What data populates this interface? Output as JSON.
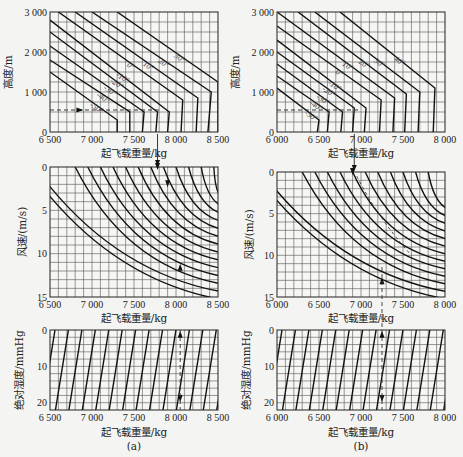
{
  "chart_data": [
    {
      "panel": "a",
      "caption": "(a)",
      "subcharts": [
        {
          "id": "a-top",
          "type": "line",
          "xlabel": "起飞载重量/kg",
          "ylabel": "高度/m",
          "xlim": [
            6500,
            8500
          ],
          "ylim": [
            0,
            3000
          ],
          "xticks": [
            6500,
            7000,
            7500,
            8000,
            8500
          ],
          "xtick_labels": [
            "6 500",
            "7 000",
            "7 500",
            "8 000",
            "8 500"
          ],
          "yticks": [
            0,
            1000,
            2000,
            3000
          ],
          "ytick_labels": [
            "0",
            "1 000",
            "2 000",
            "3 000"
          ],
          "grid": true,
          "grid_nx": 20,
          "grid_ny": 12,
          "series_note": "Temperature lines (°C); diagonal segment then near-vertical segment to 0 m",
          "series": [
            {
              "name": "-50°",
              "kink": [
                7300,
                300
              ],
              "top": [
                6500,
                1500
              ],
              "bottom": [
                7300,
                0
              ]
            },
            {
              "name": "-40°",
              "kink": [
                7450,
                500
              ],
              "top": [
                6500,
                1800
              ],
              "bottom": [
                7450,
                0
              ]
            },
            {
              "name": "-30°",
              "kink": [
                7620,
                500
              ],
              "top": [
                6500,
                2150
              ],
              "bottom": [
                7600,
                0
              ]
            },
            {
              "name": "-20°",
              "kink": [
                7780,
                500
              ],
              "top": [
                6500,
                2500
              ],
              "bottom": [
                7760,
                0
              ]
            },
            {
              "name": "-10°",
              "kink": [
                7920,
                500
              ],
              "top": [
                6500,
                2800
              ],
              "bottom": [
                7900,
                0
              ]
            },
            {
              "name": "0°",
              "kink": [
                8080,
                800
              ],
              "top": [
                6600,
                3000
              ],
              "bottom": [
                8060,
                0
              ]
            },
            {
              "name": "10°",
              "kink": [
                8260,
                850
              ],
              "top": [
                6800,
                3000
              ],
              "bottom": [
                8240,
                0
              ]
            },
            {
              "name": "20°",
              "kink": [
                8420,
                1000
              ],
              "top": [
                7000,
                3000
              ],
              "bottom": [
                8380,
                0
              ]
            },
            {
              "name": "30°",
              "kink": [
                8500,
                1250
              ],
              "top": [
                7300,
                3000
              ],
              "bottom": [
                8500,
                1250
              ]
            }
          ],
          "annotations": [
            {
              "type": "dashed-line",
              "y": 550,
              "x_from": 6500,
              "x_to": 7800
            },
            {
              "type": "arrow",
              "at": [
                6850,
                550
              ],
              "direction": "right"
            }
          ]
        },
        {
          "id": "a-mid",
          "type": "line",
          "xlabel": "起飞载重量/kg",
          "ylabel": "风速/(m/s)",
          "xlim": [
            6500,
            8500
          ],
          "ylim": [
            0,
            15
          ],
          "y_inverted": true,
          "xticks": [
            6500,
            7000,
            7500,
            8000,
            8500
          ],
          "xtick_labels": [
            "6 500",
            "7 000",
            "7 500",
            "8 000",
            "8 500"
          ],
          "yticks": [
            0,
            5,
            10,
            15
          ],
          "ytick_labels": [
            "0",
            "5",
            "10",
            "15"
          ],
          "grid": true,
          "grid_nx": 20,
          "grid_ny": 15,
          "series_note": "Family of curved guide lines starting at 0 m/s and descending right",
          "series_starts_x": [
            6500,
            6650,
            6800,
            6950,
            7100,
            7250,
            7400,
            7550,
            7700,
            7850,
            8000,
            8150,
            8300,
            8450
          ],
          "annotations": [
            {
              "type": "arrow",
              "at": [
                7780,
                0
              ],
              "direction": "down",
              "from_chart": "a-top"
            },
            {
              "type": "arrow",
              "at": [
                7900,
                2
              ],
              "direction": "down"
            },
            {
              "type": "arrow",
              "at": [
                8050,
                11.5
              ],
              "direction": "up"
            }
          ]
        },
        {
          "id": "a-bottom",
          "type": "line",
          "xlabel": "起飞载重量/kg",
          "ylabel": "绝对湿度/mmHg",
          "xlim": [
            6500,
            8500
          ],
          "ylim": [
            0,
            22
          ],
          "y_inverted": true,
          "xticks": [
            6500,
            7000,
            7500,
            8000,
            8500
          ],
          "xtick_labels": [
            "6 500",
            "7 000",
            "7 500",
            "8 000",
            "8 500"
          ],
          "yticks": [
            0,
            10,
            20
          ],
          "ytick_labels": [
            "0",
            "10",
            "20"
          ],
          "grid": true,
          "grid_nx": 20,
          "grid_ny": 11,
          "series_note": "Parallel slanted guide lines",
          "annotations": [
            {
              "type": "arrow",
              "at": [
                8050,
                1
              ],
              "direction": "up"
            },
            {
              "type": "arrow",
              "at": [
                8050,
                19
              ],
              "direction": "down"
            }
          ]
        }
      ]
    },
    {
      "panel": "b",
      "caption": "(b)",
      "subcharts": [
        {
          "id": "b-top",
          "type": "line",
          "xlabel": "起飞载重量/kg",
          "ylabel": "高度/m",
          "xlim": [
            6000,
            8000
          ],
          "ylim": [
            0,
            3000
          ],
          "xticks": [
            6000,
            6500,
            7000,
            7500,
            8000
          ],
          "xtick_labels": [
            "6 000",
            "6 500",
            "7 000",
            "7 500",
            "8 000"
          ],
          "yticks": [
            0,
            1000,
            2000,
            3000
          ],
          "ytick_labels": [
            "0",
            "1 000",
            "2 000",
            "3 000"
          ],
          "grid": true,
          "grid_nx": 20,
          "grid_ny": 12,
          "series": [
            {
              "name": "-50°",
              "kink": [
                6500,
                300
              ],
              "top": [
                6000,
                1100
              ]
            },
            {
              "name": "-40°",
              "kink": [
                6620,
                500
              ],
              "top": [
                6000,
                1400
              ]
            },
            {
              "name": "-30°",
              "kink": [
                6780,
                500
              ],
              "top": [
                6000,
                1700
              ]
            },
            {
              "name": "-20°",
              "kink": [
                6920,
                600
              ],
              "top": [
                6000,
                2000
              ]
            },
            {
              "name": "-10°",
              "kink": [
                7060,
                600
              ],
              "top": [
                6000,
                2300
              ]
            },
            {
              "name": "0°",
              "kink": [
                7240,
                800
              ],
              "top": [
                6000,
                2650
              ]
            },
            {
              "name": "10°",
              "kink": [
                7400,
                850
              ],
              "top": [
                6000,
                3000
              ]
            },
            {
              "name": "20°",
              "kink": [
                7540,
                950
              ],
              "top": [
                6250,
                3000
              ]
            },
            {
              "name": "30°",
              "kink": [
                7700,
                1000
              ],
              "top": [
                6450,
                3000
              ]
            },
            {
              "name": "40°",
              "kink": [
                7880,
                1100
              ],
              "top": [
                6750,
                3000
              ]
            }
          ],
          "annotations": [
            {
              "type": "dashed-line",
              "y": 550,
              "x_from": 6000,
              "x_to": 7000
            }
          ]
        },
        {
          "id": "b-mid",
          "type": "line",
          "xlabel": "起飞载重量/kg",
          "ylabel": "风速/(m/s)",
          "xlim": [
            6000,
            8000
          ],
          "ylim": [
            0,
            15
          ],
          "y_inverted": true,
          "xticks": [
            6000,
            6500,
            7000,
            7500,
            8000
          ],
          "xtick_labels": [
            "6 000",
            "6 500",
            "7 000",
            "7 500",
            "8 000"
          ],
          "yticks": [
            0,
            5,
            10,
            15
          ],
          "ytick_labels": [
            "0",
            "5",
            "10",
            "15"
          ],
          "grid": true,
          "grid_nx": 20,
          "grid_ny": 15,
          "series_starts_x": [
            6000,
            6150,
            6300,
            6450,
            6600,
            6750,
            6900,
            7050,
            7200,
            7350,
            7500,
            7650,
            7800
          ],
          "annotations": [
            {
              "type": "arrow",
              "at": [
                6900,
                0
              ],
              "direction": "down",
              "from_chart": "b-top"
            },
            {
              "type": "dashed-curve",
              "from": [
                6950,
                0.5
              ],
              "to": [
                7600,
                10
              ]
            },
            {
              "type": "arrow",
              "at": [
                7250,
                13
              ],
              "direction": "up"
            }
          ]
        },
        {
          "id": "b-bottom",
          "type": "line",
          "xlabel": "起飞载重量/kg",
          "ylabel": "绝对湿度/mmHg",
          "xlim": [
            6000,
            8000
          ],
          "ylim": [
            0,
            22
          ],
          "y_inverted": true,
          "xticks": [
            6000,
            6500,
            7000,
            7500,
            8000
          ],
          "xtick_labels": [
            "6 000",
            "6 500",
            "7 000",
            "7 500",
            "8 000"
          ],
          "yticks": [
            0,
            10,
            20
          ],
          "ytick_labels": [
            "0",
            "10",
            "20"
          ],
          "grid": true,
          "grid_nx": 20,
          "grid_ny": 11,
          "annotations": [
            {
              "type": "arrow",
              "at": [
                7250,
                1
              ],
              "direction": "up"
            },
            {
              "type": "arrow",
              "at": [
                7250,
                19
              ],
              "direction": "down"
            }
          ]
        }
      ]
    }
  ],
  "labels": {
    "x_axis": "起飞载重量/kg",
    "alt": "高度/m",
    "wind": "风速/(m/s)",
    "hum": "绝对湿度/mmHg",
    "cap_a": "(a)",
    "cap_b": "(b)",
    "temps_a": [
      "-50°",
      "-40°",
      "-30°",
      "-20°",
      "-10°",
      "0°",
      "10°",
      "20°",
      "30°"
    ],
    "temps_b": [
      "-50°",
      "-40°",
      "-30°",
      "-20°",
      "-10°",
      "0°",
      "10°",
      "20°",
      "30°",
      "40°"
    ]
  }
}
